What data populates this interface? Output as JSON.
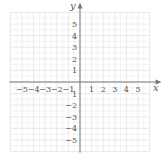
{
  "diagram": {
    "type": "coordinate-plane",
    "x_axis_label": "x",
    "y_axis_label": "y",
    "x_range": [
      -6,
      6
    ],
    "y_range": [
      -6,
      6
    ],
    "x_tick_labels": [
      {
        "value": -5,
        "text": "−5"
      },
      {
        "value": -4,
        "text": "−4"
      },
      {
        "value": -3,
        "text": "−3"
      },
      {
        "value": -2,
        "text": "−2"
      },
      {
        "value": -1,
        "text": "−1"
      },
      {
        "value": 1,
        "text": "1"
      },
      {
        "value": 2,
        "text": "2"
      },
      {
        "value": 3,
        "text": "3"
      },
      {
        "value": 4,
        "text": "4"
      },
      {
        "value": 5,
        "text": "5"
      }
    ],
    "y_tick_labels": [
      {
        "value": 5,
        "text": "5"
      },
      {
        "value": 4,
        "text": "4"
      },
      {
        "value": 3,
        "text": "3"
      },
      {
        "value": 2,
        "text": "2"
      },
      {
        "value": 1,
        "text": "1"
      },
      {
        "value": -1,
        "text": "1"
      },
      {
        "value": -2,
        "text": "−2"
      },
      {
        "value": -3,
        "text": "−3"
      },
      {
        "value": -4,
        "text": "−4"
      },
      {
        "value": -5,
        "text": "−5"
      }
    ],
    "colors": {
      "grid": "#e4e4e4",
      "axis": "#777777",
      "text": "#555555"
    }
  }
}
